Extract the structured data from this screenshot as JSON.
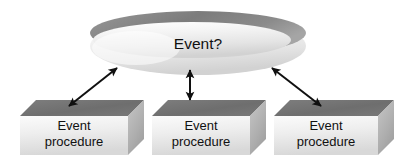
{
  "diagram": {
    "type": "event-model-diagram",
    "background_color": "#ffffff",
    "central_node": {
      "shape": "3d-disc-ellipse",
      "label": "Event?",
      "top_rim_color": "#8a8a8a",
      "body_color": "#e8e8e8",
      "highlight_color": "#fdfdfd",
      "cx": 198,
      "cy": 42,
      "rx": 108,
      "ry": 34
    },
    "boxes": [
      {
        "id": "event-procedure-1",
        "line1": "Event",
        "line2": "procedure",
        "x": 20,
        "y": 100,
        "width": 108,
        "height": 55,
        "depth": 16,
        "top_color": "#717171",
        "front_color": "#e3e3e3",
        "side_color": "#b4b4b4"
      },
      {
        "id": "event-procedure-2",
        "line1": "Event",
        "line2": "procedure",
        "x": 152,
        "y": 100,
        "width": 98,
        "height": 55,
        "depth": 16,
        "top_color": "#717171",
        "front_color": "#e3e3e3",
        "side_color": "#b4b4b4"
      },
      {
        "id": "event-procedure-3",
        "line1": "Event",
        "line2": "procedure",
        "x": 274,
        "y": 100,
        "width": 104,
        "height": 55,
        "depth": 16,
        "top_color": "#717171",
        "front_color": "#e3e3e3",
        "side_color": "#b4b4b4"
      }
    ],
    "connectors": [
      {
        "id": "connector-left",
        "style": "double-headed-arrow",
        "color": "#101010",
        "from_x": 69,
        "from_y": 106,
        "to_x": 117,
        "to_y": 68,
        "label": ""
      },
      {
        "id": "connector-middle",
        "style": "double-headed-arrow",
        "color": "#101010",
        "from_x": 190,
        "from_y": 100,
        "to_x": 190,
        "to_y": 70,
        "label": ""
      },
      {
        "id": "connector-right",
        "style": "double-headed-arrow",
        "color": "#101010",
        "from_x": 321,
        "from_y": 106,
        "to_x": 272,
        "to_y": 68,
        "label": ""
      }
    ]
  }
}
